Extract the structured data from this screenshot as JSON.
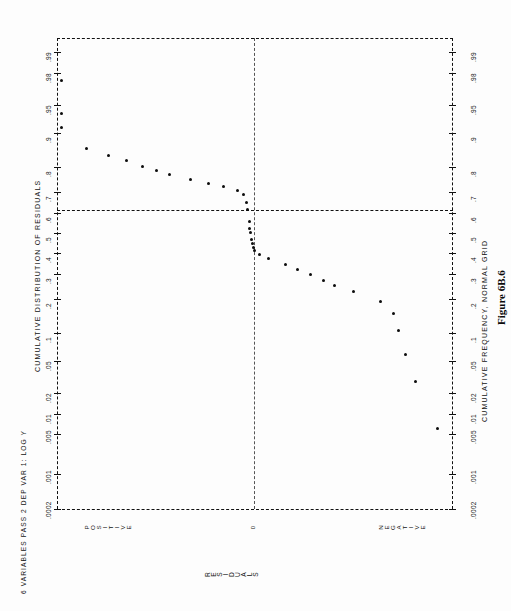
{
  "figure": {
    "caption": "Figure 6B.6",
    "header_left": "6 VARIABLES PASS 2 DEP VAR 1: LOG Y",
    "axis_title_left": "CUMULATIVE DISTRIBUTION OF RESIDUALS",
    "axis_title_right": "CUMULATIVE FREQUENCY, NORMAL GRID",
    "axis_title_bottom": "RESIDUALS",
    "region_positive": "POSITIVE",
    "region_zero": "0",
    "region_negative": "NEGATIVE"
  },
  "chart_data": {
    "type": "scatter",
    "title": "CUMULATIVE DISTRIBUTION OF RESIDUALS",
    "subtitle": "6 VARIABLES PASS 2 DEP VAR 1: LOG Y",
    "xlabel": "RESIDUALS",
    "ylabel": "CUMULATIVE FREQUENCY, NORMAL GRID",
    "orientation": "rotated-90",
    "grid": "dashed",
    "legend": "none",
    "probability_ticks": [
      ".0002",
      ".001",
      ".005",
      ".01",
      ".02",
      ".05",
      ".1",
      ".2",
      ".3",
      ".4",
      ".5",
      ".6",
      ".7",
      ".8",
      ".9",
      ".95",
      ".98",
      ".99",
      ".995",
      ".999"
    ],
    "probability_tick_values": [
      0.0002,
      0.001,
      0.005,
      0.01,
      0.02,
      0.05,
      0.1,
      0.2,
      0.3,
      0.4,
      0.5,
      0.6,
      0.7,
      0.8,
      0.9,
      0.95,
      0.98,
      0.99,
      0.995,
      0.999
    ],
    "probability_tick_y": [
      471,
      440,
      410,
      395,
      375,
      345,
      310,
      263,
      229,
      200,
      172,
      145,
      116,
      82,
      47,
      22,
      1,
      -9,
      -24,
      -46
    ],
    "x_axis_categories": [
      "POSITIVE",
      "0",
      "NEGATIVE"
    ],
    "x_axis_category_frac": [
      0.08,
      0.5,
      0.88
    ],
    "reference_lines": {
      "horizontal_p50": 0.5,
      "vertical_zero_residual": 0
    },
    "note": "Normal probability plot of residuals; points are cumulative frequency vs residual value on a normal-probability grid.",
    "points": [
      {
        "xf": 0.012,
        "pf": 0.975
      },
      {
        "xf": 0.012,
        "pf": 0.938
      },
      {
        "xf": 0.012,
        "pf": 0.912
      },
      {
        "xf": 0.075,
        "pf": 0.862
      },
      {
        "xf": 0.13,
        "pf": 0.84
      },
      {
        "xf": 0.175,
        "pf": 0.822
      },
      {
        "xf": 0.215,
        "pf": 0.803
      },
      {
        "xf": 0.25,
        "pf": 0.789
      },
      {
        "xf": 0.283,
        "pf": 0.772
      },
      {
        "xf": 0.338,
        "pf": 0.752
      },
      {
        "xf": 0.383,
        "pf": 0.735
      },
      {
        "xf": 0.42,
        "pf": 0.723
      },
      {
        "xf": 0.455,
        "pf": 0.706
      },
      {
        "xf": 0.472,
        "pf": 0.69
      },
      {
        "xf": 0.478,
        "pf": 0.65
      },
      {
        "xf": 0.482,
        "pf": 0.62
      },
      {
        "xf": 0.485,
        "pf": 0.56
      },
      {
        "xf": 0.487,
        "pf": 0.524
      },
      {
        "xf": 0.489,
        "pf": 0.5
      },
      {
        "xf": 0.492,
        "pf": 0.468
      },
      {
        "xf": 0.494,
        "pf": 0.447
      },
      {
        "xf": 0.496,
        "pf": 0.428
      },
      {
        "xf": 0.498,
        "pf": 0.41
      },
      {
        "xf": 0.512,
        "pf": 0.392
      },
      {
        "xf": 0.535,
        "pf": 0.37
      },
      {
        "xf": 0.577,
        "pf": 0.342
      },
      {
        "xf": 0.608,
        "pf": 0.32
      },
      {
        "xf": 0.64,
        "pf": 0.296
      },
      {
        "xf": 0.672,
        "pf": 0.272
      },
      {
        "xf": 0.702,
        "pf": 0.252
      },
      {
        "xf": 0.748,
        "pf": 0.228
      },
      {
        "xf": 0.818,
        "pf": 0.188
      },
      {
        "xf": 0.85,
        "pf": 0.15
      },
      {
        "xf": 0.862,
        "pf": 0.105
      },
      {
        "xf": 0.88,
        "pf": 0.06
      },
      {
        "xf": 0.905,
        "pf": 0.028
      },
      {
        "xf": 0.96,
        "pf": 0.006
      }
    ]
  }
}
